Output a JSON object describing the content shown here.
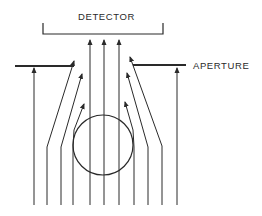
{
  "labels": {
    "detector": "DETECTOR",
    "aperture": "APERTURE"
  },
  "colors": {
    "line": "#2a2a2a",
    "background": "#ffffff"
  },
  "diagram": {
    "detector_bracket": {
      "x1": 43,
      "x2": 163,
      "top": 23,
      "bottom": 34
    },
    "aperture_left": {
      "x1": 15,
      "x2": 74,
      "y": 66
    },
    "aperture_right": {
      "x1": 133,
      "x2": 186,
      "y": 65
    },
    "object_circle": {
      "cx": 103,
      "cy": 145,
      "r": 30
    },
    "field_lines": [
      {
        "id": "far-left",
        "points": [
          [
            34,
            205
          ],
          [
            34,
            68
          ]
        ]
      },
      {
        "id": "left-2",
        "points": [
          [
            47,
            205
          ],
          [
            47,
            147
          ],
          [
            74,
            61
          ]
        ]
      },
      {
        "id": "left-3",
        "points": [
          [
            61,
            205
          ],
          [
            61,
            147
          ],
          [
            82,
            74
          ]
        ]
      },
      {
        "id": "left-4",
        "points": [
          [
            73,
            205
          ],
          [
            73,
            147
          ],
          [
            74,
            130
          ],
          [
            84,
            104
          ]
        ]
      },
      {
        "id": "center-left",
        "points": [
          [
            90,
            205
          ],
          [
            90,
            40
          ]
        ]
      },
      {
        "id": "center",
        "points": [
          [
            104,
            205
          ],
          [
            104,
            40
          ]
        ]
      },
      {
        "id": "center-right",
        "points": [
          [
            119,
            205
          ],
          [
            119,
            40
          ]
        ]
      },
      {
        "id": "right-4",
        "points": [
          [
            134,
            205
          ],
          [
            134,
            147
          ],
          [
            133,
            130
          ],
          [
            125,
            102
          ]
        ]
      },
      {
        "id": "right-3",
        "points": [
          [
            148,
            205
          ],
          [
            148,
            147
          ],
          [
            127,
            73
          ]
        ]
      },
      {
        "id": "right-2",
        "points": [
          [
            162,
            205
          ],
          [
            162,
            146
          ],
          [
            130,
            57
          ]
        ]
      },
      {
        "id": "far-right",
        "points": [
          [
            177,
            205
          ],
          [
            177,
            68
          ]
        ]
      }
    ]
  }
}
